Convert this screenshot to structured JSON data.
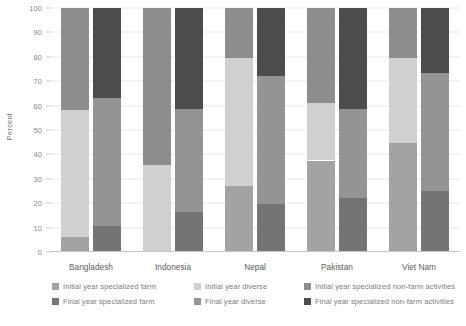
{
  "chart_data": {
    "type": "bar",
    "subtype": "stacked-grouped-100-percent",
    "title": "",
    "xlabel": "",
    "ylabel": "Percent",
    "ylim": [
      0,
      100
    ],
    "yticks": [
      0,
      10,
      20,
      30,
      40,
      50,
      60,
      70,
      80,
      90,
      100
    ],
    "ytick_labels": [
      "0",
      "10",
      "20",
      "30",
      "40",
      "50",
      "60",
      "70",
      "80",
      "90",
      "100"
    ],
    "grid": true,
    "legend_position": "bottom",
    "categories": [
      "Bangladesh",
      "Indonesia",
      "Nepal",
      "Pakistan",
      "Viet Nam"
    ],
    "bar_groups": [
      "Initial year",
      "Final year"
    ],
    "series": [
      {
        "name": "Initial year specialized farm",
        "group": "Initial year",
        "color": "#a3a3a3",
        "values": [
          6.0,
          0.0,
          27.0,
          37.5,
          44.5
        ]
      },
      {
        "name": "Initial year diverse",
        "group": "Initial year",
        "color": "#d0d0d0",
        "values": [
          52.0,
          35.5,
          52.5,
          23.5,
          35.0
        ]
      },
      {
        "name": "Initial year specialized non-farm activities",
        "group": "Initial year",
        "color": "#8d8d8d",
        "values": [
          42.0,
          64.5,
          20.5,
          39.0,
          20.5
        ]
      },
      {
        "name": "Final year specialized farm",
        "group": "Final year",
        "color": "#747474",
        "values": [
          10.5,
          16.5,
          19.5,
          22.0,
          25.0
        ]
      },
      {
        "name": "Final year diverse",
        "group": "Final year",
        "color": "#949494",
        "values": [
          52.5,
          42.0,
          52.5,
          36.5,
          48.5
        ]
      },
      {
        "name": "Final year specialized non-farm activities",
        "group": "Final year",
        "color": "#4c4c4c",
        "values": [
          37.0,
          41.5,
          28.0,
          41.5,
          26.5
        ]
      }
    ],
    "cumulative_tops": {
      "Bangladesh": {
        "initial": [
          6.0,
          58.0,
          100.0
        ],
        "final": [
          10.5,
          63.0,
          100.0
        ]
      },
      "Indonesia": {
        "initial": [
          0.0,
          35.5,
          100.0
        ],
        "final": [
          16.5,
          58.5,
          100.0
        ]
      },
      "Nepal": {
        "initial": [
          27.0,
          79.5,
          100.0
        ],
        "final": [
          19.5,
          72.0,
          100.0
        ]
      },
      "Pakistan": {
        "initial": [
          37.5,
          61.0,
          100.0
        ],
        "final": [
          22.0,
          58.5,
          100.0
        ]
      },
      "Viet Nam": {
        "initial": [
          44.5,
          79.5,
          100.0
        ],
        "final": [
          25.0,
          73.5,
          100.0
        ]
      }
    }
  },
  "legend": {
    "row1": [
      {
        "label": "Initial year specialized farm",
        "color": "#a3a3a3"
      },
      {
        "label": "Initial year diverse",
        "color": "#d0d0d0"
      },
      {
        "label": "Initial year specialized non-farm activities",
        "color": "#8d8d8d"
      }
    ],
    "row2": [
      {
        "label": "Final year specialized farm",
        "color": "#747474"
      },
      {
        "label": "Final year diverse",
        "color": "#949494"
      },
      {
        "label": "Final year specialized non-farm activities",
        "color": "#4c4c4c"
      }
    ]
  }
}
